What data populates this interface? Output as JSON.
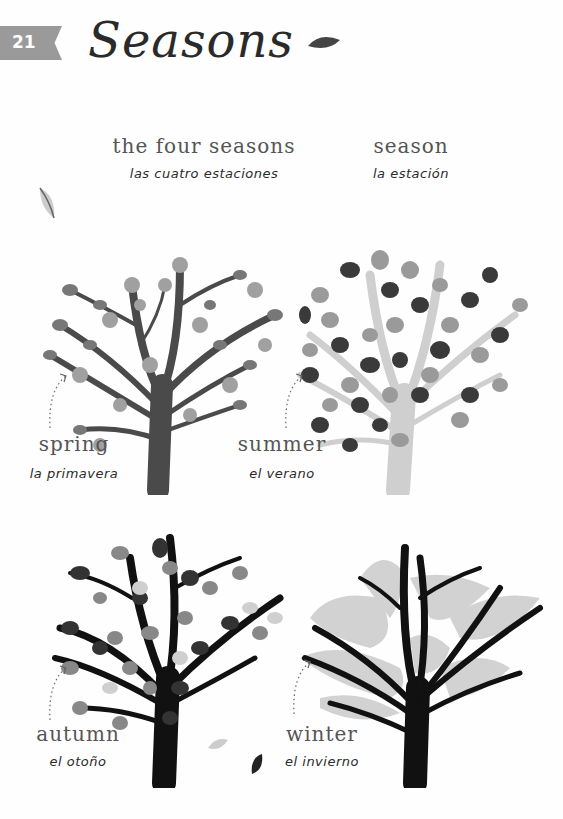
{
  "page": {
    "number": "21",
    "title": "Seasons"
  },
  "vocabulary": [
    {
      "english": "the four seasons",
      "spanish": "las cuatro estaciones"
    },
    {
      "english": "season",
      "spanish": "la estación"
    }
  ],
  "seasons": [
    {
      "english": "spring",
      "spanish": "la primavera",
      "illustration": "spring-tree-with-blossoms"
    },
    {
      "english": "summer",
      "spanish": "el verano",
      "illustration": "summer-tree-full-leaves"
    },
    {
      "english": "autumn",
      "spanish": "el otoño",
      "illustration": "autumn-tree-falling-leaves"
    },
    {
      "english": "winter",
      "spanish": "el invierno",
      "illustration": "winter-tree-with-snow"
    }
  ],
  "colors": {
    "tab": "#9a9a9a",
    "dark": "#2a2a2a",
    "mid": "#888888",
    "light": "#cfcfcf"
  }
}
